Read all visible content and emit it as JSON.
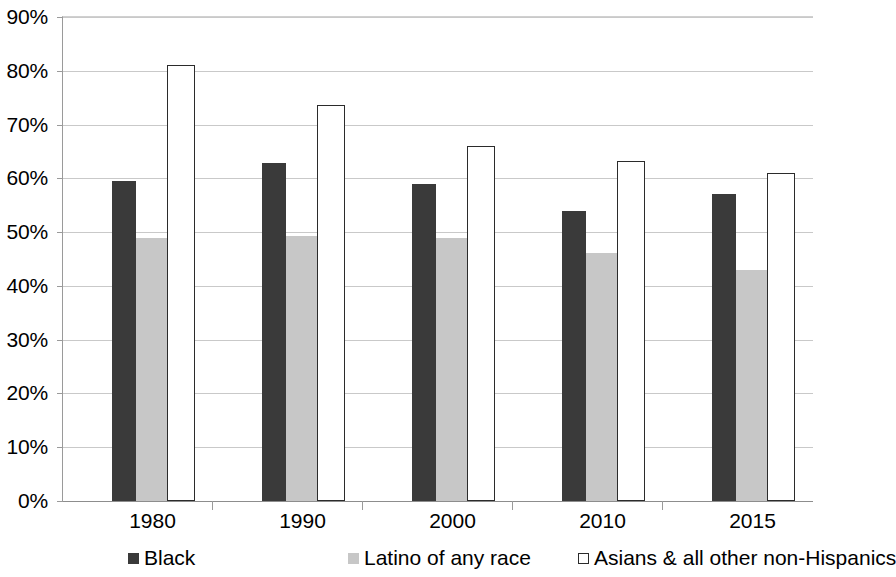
{
  "chart_data": {
    "type": "bar",
    "title": "",
    "subtitle": "",
    "xlabel": "",
    "ylabel": "",
    "categories": [
      "1980",
      "1990",
      "2000",
      "2010",
      "2015"
    ],
    "series": [
      {
        "name": "Black",
        "color": "#3a3a3a",
        "values": [
          59.5,
          62.8,
          59.0,
          54.0,
          57.0
        ]
      },
      {
        "name": "Latino of any race",
        "color": "#c7c7c7",
        "values": [
          49.0,
          49.2,
          49.0,
          46.2,
          43.0
        ]
      },
      {
        "name": "Asians & all other non-Hispanics",
        "color": "#ffffff",
        "values": [
          81.0,
          73.6,
          66.0,
          63.2,
          61.0
        ]
      }
    ],
    "ylim": [
      0,
      90
    ],
    "ytick_step": 10,
    "ytick_labels": [
      "0%",
      "10%",
      "20%",
      "30%",
      "40%",
      "50%",
      "60%",
      "70%",
      "80%",
      "90%"
    ],
    "ytick_values": [
      0,
      10,
      20,
      30,
      40,
      50,
      60,
      70,
      80,
      90
    ],
    "grid": true,
    "grid_axis": "y",
    "legend_position": "bottom",
    "value_format": "percent"
  }
}
